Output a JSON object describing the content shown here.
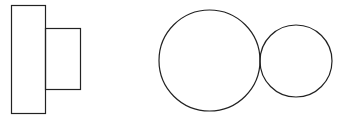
{
  "diagram": {
    "background": "#ffffff",
    "stroke": "#222222",
    "shapes": {
      "tall_rect": {
        "x": 11.5,
        "y": 5.5,
        "w": 34,
        "h": 108
      },
      "small_rect": {
        "x": 45.5,
        "y": 28.5,
        "w": 35,
        "h": 61
      },
      "large_circle": {
        "cx": 209.5,
        "cy": 60.5,
        "r": 50.5
      },
      "small_circle": {
        "cx": 296,
        "cy": 61,
        "r": 36
      }
    }
  }
}
